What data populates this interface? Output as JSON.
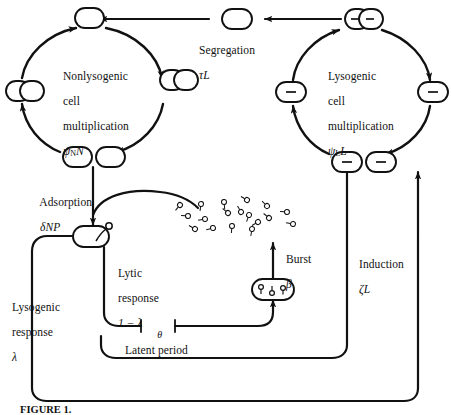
{
  "figure": {
    "domain": "diagram",
    "caption": "FIGURE 1.",
    "background_color": "#ffffff",
    "stroke_color": "#111111"
  },
  "labels": {
    "nonlysogenic_cycle": {
      "line1": "Nonlysogenic",
      "line2": "cell",
      "line3": "multiplication",
      "rate_symbol": "ψ",
      "rate_sub": "N",
      "rate_var": "N"
    },
    "lysogenic_cycle": {
      "line1": "Lysogenic",
      "line2": "cell",
      "line3": "multiplication",
      "rate_symbol": "ψ",
      "rate_sub": "L",
      "rate_var": "L"
    },
    "segregation": {
      "name": "Segregation",
      "rate": "τL"
    },
    "adsorption": {
      "name": "Adsorption",
      "rate": "δNP"
    },
    "lytic_response": {
      "line1": "Lytic",
      "line2": "response",
      "rate": "1 − λ"
    },
    "lysogenic_response": {
      "line1": "Lysogenic",
      "line2": "response",
      "rate": "λ"
    },
    "burst": {
      "name": "Burst",
      "rate": "β"
    },
    "latent_period": {
      "name": "Latent period",
      "rate": "θ"
    },
    "induction": {
      "name": "Induction",
      "rate": "ζL"
    }
  },
  "nodes": {
    "nonlysogenic_top": {
      "kind": "single-cell",
      "marker": ""
    },
    "nonlysogenic_right": {
      "kind": "dividing-cell",
      "marker": ""
    },
    "nonlysogenic_bottom": {
      "kind": "two-cells",
      "marker": ""
    },
    "nonlysogenic_left": {
      "kind": "dividing-cell",
      "marker": ""
    },
    "segregation_cell": {
      "kind": "single-cell",
      "marker": ""
    },
    "lysogenic_top": {
      "kind": "dividing-cell",
      "marker": "−"
    },
    "lysogenic_right": {
      "kind": "single-cell",
      "marker": "−"
    },
    "lysogenic_bottom": {
      "kind": "two-cells",
      "marker": "−"
    },
    "lysogenic_left": {
      "kind": "single-cell",
      "marker": "−"
    },
    "infected_cell": {
      "kind": "cell-with-phage",
      "marker": "phage"
    },
    "lysing_cell": {
      "kind": "cell-with-phages",
      "marker": "phages"
    },
    "free_phage_count": 18
  },
  "flows": [
    {
      "from": "nonlysogenic_bottom",
      "to": "infected_cell",
      "label": "adsorption"
    },
    {
      "from": "infected_cell",
      "to": "lysing_cell",
      "label": "lytic_response"
    },
    {
      "from": "lysing_cell",
      "to": "free_phage",
      "label": "burst"
    },
    {
      "from": "infected_cell",
      "to": "lysogenic_cycle",
      "label": "lysogenic_response"
    },
    {
      "from": "lysogenic_bottom",
      "to": "free_phage",
      "label": "induction"
    },
    {
      "from": "lysogenic_top",
      "to": "segregation_cell",
      "label": "segregation"
    },
    {
      "from": "segregation_cell",
      "to": "nonlysogenic_top",
      "label": ""
    },
    {
      "from": "latent_period",
      "to": "lysing_cell",
      "label": "latent_period"
    }
  ]
}
